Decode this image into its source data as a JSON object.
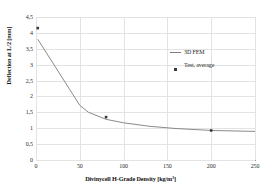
{
  "chart_data": {
    "type": "line",
    "title": "",
    "xlabel": "Divinycell H-Grade Density [kg/m³]",
    "ylabel": "Deflection at L/2 [mm]",
    "xlim": [
      0,
      250
    ],
    "ylim": [
      0,
      4.5
    ],
    "xticks": [
      0,
      50,
      100,
      150,
      200,
      250
    ],
    "xtick_labels": [
      "0",
      "50",
      "100",
      "150",
      "200",
      "250"
    ],
    "yticks": [
      0,
      0.5,
      1,
      1.5,
      2,
      2.5,
      3,
      3.5,
      4,
      4.5
    ],
    "ytick_labels": [
      "0",
      "0,5",
      "1",
      "1,5",
      "2",
      "2,5",
      "3",
      "3,5",
      "4",
      "4,5"
    ],
    "grid": true,
    "legend_position": "upper right",
    "series": [
      {
        "name": "3D FEM",
        "type": "line",
        "color": "#7d7d7d",
        "x": [
          2,
          50,
          60,
          80,
          100,
          130,
          160,
          200,
          250
        ],
        "y": [
          3.8,
          1.72,
          1.5,
          1.28,
          1.17,
          1.06,
          0.99,
          0.93,
          0.9
        ]
      },
      {
        "name": "Test, average",
        "type": "scatter",
        "color": "#3a3a3a",
        "x": [
          2,
          80,
          200
        ],
        "y": [
          4.15,
          1.35,
          0.93
        ]
      }
    ]
  },
  "legend": {
    "items": [
      {
        "label": "3D FEM",
        "marker": "line"
      },
      {
        "label": "Test, average",
        "marker": "square"
      }
    ]
  }
}
